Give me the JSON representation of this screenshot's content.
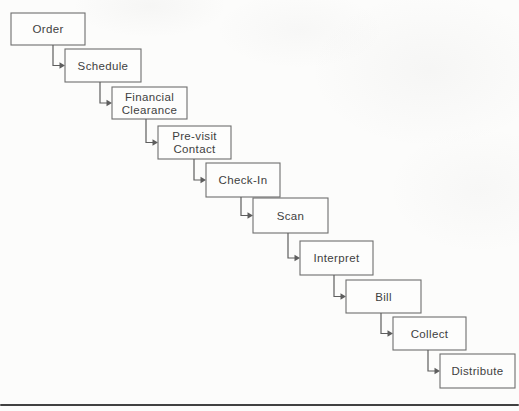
{
  "page": {
    "background": "#fcfcfb",
    "bottom_rule_color": "#414141"
  },
  "diagram": {
    "type": "cascade-flow",
    "steps": [
      {
        "label": "Order",
        "lines": [
          "Order"
        ]
      },
      {
        "label": "Schedule",
        "lines": [
          "Schedule"
        ]
      },
      {
        "label": "Financial Clearance",
        "lines": [
          "Financial",
          "Clearance"
        ]
      },
      {
        "label": "Pre-visit Contact",
        "lines": [
          "Pre-visit",
          "Contact"
        ]
      },
      {
        "label": "Check-In",
        "lines": [
          "Check-In"
        ]
      },
      {
        "label": "Scan",
        "lines": [
          "Scan"
        ]
      },
      {
        "label": "Interpret",
        "lines": [
          "Interpret"
        ]
      },
      {
        "label": "Bill",
        "lines": [
          "Bill"
        ]
      },
      {
        "label": "Collect",
        "lines": [
          "Collect"
        ]
      },
      {
        "label": "Distribute",
        "lines": [
          "Distribute"
        ]
      }
    ],
    "colors": {
      "box_fill": "#fdfdfc",
      "box_border": "#6e6e6e",
      "text": "#3f3f3f",
      "connector": "#5e5e5e"
    }
  }
}
